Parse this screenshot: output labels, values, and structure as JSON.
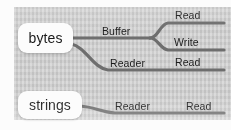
{
  "diagram": {
    "background_color": "#d0d0d0",
    "node_fill_color": "#fdfdfd",
    "branch_color": "#6e6e6e",
    "text_color": "#1a1a1a",
    "nodes": [
      {
        "id": "bytes",
        "label": "bytes"
      },
      {
        "id": "strings",
        "label": "strings"
      }
    ],
    "branches": [
      {
        "id": "bytes-buffer",
        "from": "bytes",
        "label": "Buffer",
        "children": [
          {
            "id": "buffer-read",
            "label": "Read"
          },
          {
            "id": "buffer-write",
            "label": "Write"
          }
        ]
      },
      {
        "id": "bytes-reader",
        "from": "bytes",
        "label": "Reader",
        "children": [
          {
            "id": "bytes-reader-read",
            "label": "Read"
          }
        ]
      },
      {
        "id": "strings-reader",
        "from": "strings",
        "label": "Reader",
        "children": [
          {
            "id": "strings-reader-read",
            "label": "Read"
          }
        ]
      }
    ]
  }
}
